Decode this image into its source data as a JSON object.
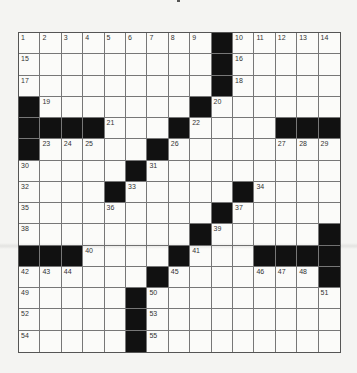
{
  "puzzle": {
    "rows": 15,
    "cols": 15,
    "colors": {
      "block": "#111111",
      "cell": "#fbfbf9",
      "line": "#777777",
      "page": "#f4f4f2"
    },
    "blocks": [
      [
        0,
        9
      ],
      [
        1,
        9
      ],
      [
        2,
        9
      ],
      [
        3,
        0
      ],
      [
        3,
        8
      ],
      [
        4,
        0
      ],
      [
        4,
        1
      ],
      [
        4,
        2
      ],
      [
        4,
        3
      ],
      [
        4,
        7
      ],
      [
        4,
        12
      ],
      [
        4,
        13
      ],
      [
        4,
        14
      ],
      [
        5,
        0
      ],
      [
        5,
        6
      ],
      [
        6,
        5
      ],
      [
        7,
        4
      ],
      [
        7,
        10
      ],
      [
        8,
        9
      ],
      [
        9,
        8
      ],
      [
        9,
        14
      ],
      [
        10,
        0
      ],
      [
        10,
        1
      ],
      [
        10,
        2
      ],
      [
        10,
        7
      ],
      [
        10,
        11
      ],
      [
        10,
        12
      ],
      [
        10,
        13
      ],
      [
        10,
        14
      ],
      [
        11,
        6
      ],
      [
        11,
        14
      ],
      [
        12,
        5
      ],
      [
        13,
        5
      ],
      [
        14,
        5
      ]
    ],
    "numbers": [
      {
        "r": 0,
        "c": 0,
        "n": "1"
      },
      {
        "r": 0,
        "c": 1,
        "n": "2"
      },
      {
        "r": 0,
        "c": 2,
        "n": "3"
      },
      {
        "r": 0,
        "c": 3,
        "n": "4"
      },
      {
        "r": 0,
        "c": 4,
        "n": "5"
      },
      {
        "r": 0,
        "c": 5,
        "n": "6"
      },
      {
        "r": 0,
        "c": 6,
        "n": "7"
      },
      {
        "r": 0,
        "c": 7,
        "n": "8"
      },
      {
        "r": 0,
        "c": 8,
        "n": "9"
      },
      {
        "r": 0,
        "c": 10,
        "n": "10"
      },
      {
        "r": 0,
        "c": 11,
        "n": "11"
      },
      {
        "r": 0,
        "c": 12,
        "n": "12"
      },
      {
        "r": 0,
        "c": 13,
        "n": "13"
      },
      {
        "r": 0,
        "c": 14,
        "n": "14"
      },
      {
        "r": 1,
        "c": 0,
        "n": "15"
      },
      {
        "r": 1,
        "c": 10,
        "n": "16"
      },
      {
        "r": 2,
        "c": 0,
        "n": "17"
      },
      {
        "r": 2,
        "c": 10,
        "n": "18"
      },
      {
        "r": 3,
        "c": 1,
        "n": "19"
      },
      {
        "r": 3,
        "c": 9,
        "n": "20"
      },
      {
        "r": 4,
        "c": 4,
        "n": "21"
      },
      {
        "r": 4,
        "c": 8,
        "n": "22"
      },
      {
        "r": 5,
        "c": 1,
        "n": "23"
      },
      {
        "r": 5,
        "c": 2,
        "n": "24"
      },
      {
        "r": 5,
        "c": 3,
        "n": "25"
      },
      {
        "r": 5,
        "c": 7,
        "n": "26"
      },
      {
        "r": 5,
        "c": 12,
        "n": "27"
      },
      {
        "r": 5,
        "c": 13,
        "n": "28"
      },
      {
        "r": 5,
        "c": 14,
        "n": "29"
      },
      {
        "r": 6,
        "c": 0,
        "n": "30"
      },
      {
        "r": 6,
        "c": 6,
        "n": "31"
      },
      {
        "r": 7,
        "c": 0,
        "n": "32"
      },
      {
        "r": 7,
        "c": 5,
        "n": "33"
      },
      {
        "r": 7,
        "c": 11,
        "n": "34"
      },
      {
        "r": 8,
        "c": 0,
        "n": "35"
      },
      {
        "r": 8,
        "c": 4,
        "n": "36"
      },
      {
        "r": 8,
        "c": 10,
        "n": "37"
      },
      {
        "r": 9,
        "c": 0,
        "n": "38"
      },
      {
        "r": 9,
        "c": 9,
        "n": "39"
      },
      {
        "r": 10,
        "c": 3,
        "n": "40"
      },
      {
        "r": 10,
        "c": 8,
        "n": "41"
      },
      {
        "r": 11,
        "c": 0,
        "n": "42"
      },
      {
        "r": 11,
        "c": 1,
        "n": "43"
      },
      {
        "r": 11,
        "c": 2,
        "n": "44"
      },
      {
        "r": 11,
        "c": 7,
        "n": "45"
      },
      {
        "r": 11,
        "c": 11,
        "n": "46"
      },
      {
        "r": 11,
        "c": 12,
        "n": "47"
      },
      {
        "r": 11,
        "c": 13,
        "n": "48"
      },
      {
        "r": 12,
        "c": 0,
        "n": "49"
      },
      {
        "r": 12,
        "c": 6,
        "n": "50"
      },
      {
        "r": 12,
        "c": 14,
        "n": "51"
      },
      {
        "r": 13,
        "c": 0,
        "n": "52"
      },
      {
        "r": 13,
        "c": 6,
        "n": "53"
      },
      {
        "r": 14,
        "c": 0,
        "n": "54"
      },
      {
        "r": 14,
        "c": 6,
        "n": "55"
      }
    ]
  }
}
